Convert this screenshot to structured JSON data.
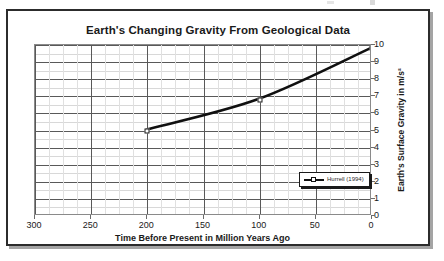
{
  "chart_data": {
    "type": "line",
    "title": "Earth's Changing Gravity From Geological Data",
    "xlabel": "Time Before Present in Million Years Ago",
    "ylabel": "Earth's Surface Gravity in m/s²",
    "x": [
      200,
      100,
      0
    ],
    "series": [
      {
        "name": "Hurrell (1994)",
        "values": [
          5.0,
          6.8,
          9.8
        ]
      }
    ],
    "xlim": [
      300,
      0
    ],
    "ylim": [
      0,
      10
    ],
    "x_reversed": true,
    "xticks": [
      300,
      250,
      200,
      150,
      100,
      50,
      0
    ],
    "xticklabels": [
      "300",
      "250",
      "200",
      "150",
      "100",
      "50",
      "0"
    ],
    "yticks": [
      0,
      1,
      2,
      3,
      4,
      5,
      6,
      7,
      8,
      9,
      10
    ],
    "yticklabels": [
      "0",
      "1",
      "2",
      "3",
      "4",
      "5",
      "6",
      "7",
      "8",
      "9",
      "10"
    ],
    "x_minor_step": 12.5,
    "y_minor_step": 0.5,
    "grid": true,
    "legend_position": "lower right",
    "legend_entries": [
      "Hurrell (1994)"
    ],
    "y_axis_side": "right",
    "line_color": "#101010",
    "marker_face_color": "#ffffff",
    "marker_edge_color": "#1a1a1a",
    "grid_major_color": "#595959",
    "grid_minor_color": "#d8d8d8",
    "frame_color": "#2c2c2c",
    "background_color": "#ffffff"
  }
}
